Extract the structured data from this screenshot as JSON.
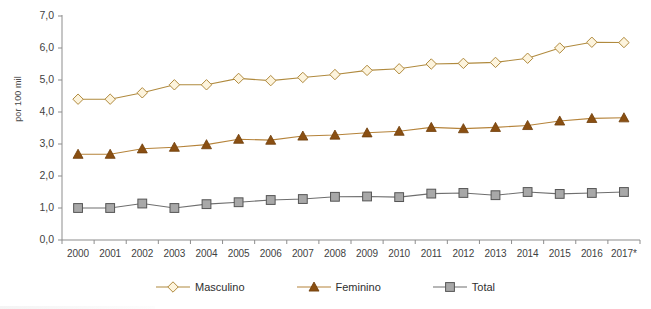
{
  "chart_data": {
    "type": "line",
    "title": "",
    "xlabel": "",
    "ylabel": "por 100 mil",
    "categories": [
      "2000",
      "2001",
      "2002",
      "2003",
      "2004",
      "2005",
      "2006",
      "2007",
      "2008",
      "2009",
      "2010",
      "2011",
      "2012",
      "2013",
      "2014",
      "2015",
      "2016",
      "2017*"
    ],
    "ylim": [
      0,
      7
    ],
    "ytick_labels": [
      "0,0",
      "1,0",
      "2,0",
      "3,0",
      "4,0",
      "5,0",
      "6,0",
      "7,0"
    ],
    "ytick_values": [
      0,
      1,
      2,
      3,
      4,
      5,
      6,
      7
    ],
    "grid": false,
    "legend_position": "bottom",
    "series": [
      {
        "name": "Masculino",
        "marker": "diamond",
        "color": "#b08a3e",
        "marker_fill": "#fdf4dd",
        "values": [
          4.4,
          4.4,
          4.6,
          4.85,
          4.85,
          5.05,
          4.98,
          5.08,
          5.17,
          5.3,
          5.35,
          5.5,
          5.52,
          5.55,
          5.68,
          6.0,
          6.18,
          6.17
        ]
      },
      {
        "name": "Feminino",
        "marker": "triangle",
        "color": "#b5833a",
        "marker_fill": "#8a4f12",
        "values": [
          2.68,
          2.68,
          2.85,
          2.9,
          2.98,
          3.15,
          3.12,
          3.25,
          3.28,
          3.35,
          3.4,
          3.52,
          3.48,
          3.52,
          3.58,
          3.72,
          3.8,
          3.82
        ]
      },
      {
        "name": "Total",
        "marker": "square",
        "color": "#6e6e6e",
        "marker_fill": "#a8a8a8",
        "values": [
          1.0,
          1.0,
          1.14,
          1.0,
          1.12,
          1.18,
          1.25,
          1.28,
          1.35,
          1.36,
          1.34,
          1.45,
          1.47,
          1.4,
          1.5,
          1.44,
          1.47,
          1.5
        ]
      }
    ]
  },
  "legend": {
    "items": [
      {
        "label": "Masculino"
      },
      {
        "label": "Feminino"
      },
      {
        "label": "Total"
      }
    ]
  },
  "axis": {
    "y_title": "por 100 mil"
  }
}
